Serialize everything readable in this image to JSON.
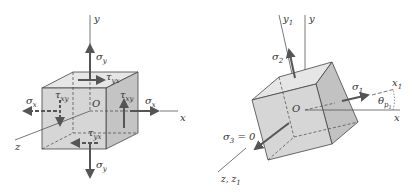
{
  "colors": {
    "face_front": "#d4d4d4",
    "face_top": "#e6e6e6",
    "face_side": "#c0c0c0",
    "edge": "#444444",
    "arrow": "#555555",
    "axis": "#555555",
    "background": "#ffffff"
  },
  "left_figure": {
    "axes": {
      "x": "x",
      "y": "y",
      "z": "z"
    },
    "origin": "O",
    "stresses": {
      "sigma_y_top": {
        "sym": "σ",
        "sub": "y"
      },
      "sigma_y_bottom": {
        "sym": "σ",
        "sub": "y"
      },
      "sigma_x_left": {
        "sym": "σ",
        "sub": "x"
      },
      "sigma_x_right": {
        "sym": "σ",
        "sub": "x"
      },
      "tau_yx_top": {
        "sym": "τ",
        "sub": "yx"
      },
      "tau_yx_bottom": {
        "sym": "τ",
        "sub": "yx"
      },
      "tau_xy_left": {
        "sym": "τ",
        "sub": "xy"
      },
      "tau_xy_right": {
        "sym": "τ",
        "sub": "xy"
      }
    }
  },
  "right_figure": {
    "axes": {
      "x": "x",
      "y": "y",
      "x1": {
        "sym": "x",
        "sub": "1"
      },
      "y1": {
        "sym": "y",
        "sub": "1"
      },
      "z": "z,",
      "z1": {
        "sym": "z",
        "sub": "1"
      }
    },
    "origin": "O",
    "stresses": {
      "sigma_1": {
        "sym": "σ",
        "sub": "1"
      },
      "sigma_2": {
        "sym": "σ",
        "sub": "2"
      },
      "sigma_3": {
        "sym": "σ",
        "sub": "3",
        "suffix": " = 0"
      }
    },
    "angle": {
      "sym": "θ",
      "sub": "p",
      "subsub": "1"
    }
  }
}
